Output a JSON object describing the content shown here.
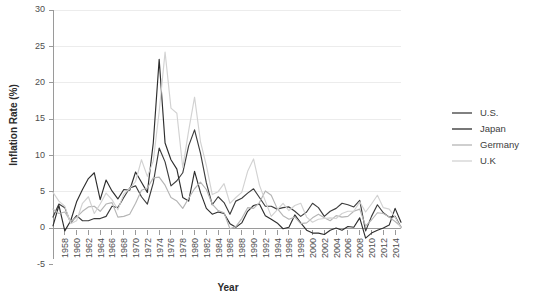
{
  "chart_data": {
    "type": "line",
    "title": "",
    "xlabel": "Year",
    "ylabel": "Inflation Rate (%)",
    "xlim": [
      1956,
      2015
    ],
    "ylim": [
      -5,
      30
    ],
    "yticks": [
      -5,
      0,
      5,
      10,
      15,
      20,
      25,
      30
    ],
    "xticks": [
      1958,
      1960,
      1962,
      1964,
      1966,
      1968,
      1970,
      1972,
      1974,
      1976,
      1978,
      1980,
      1982,
      1984,
      1986,
      1988,
      1990,
      1992,
      1994,
      1996,
      1998,
      2000,
      2002,
      2004,
      2006,
      2008,
      2010,
      2012,
      2014
    ],
    "grid": "horizontal",
    "legend_position": "right",
    "x": [
      1956,
      1957,
      1958,
      1959,
      1960,
      1961,
      1962,
      1963,
      1964,
      1965,
      1966,
      1967,
      1968,
      1969,
      1970,
      1971,
      1972,
      1973,
      1974,
      1975,
      1976,
      1977,
      1978,
      1979,
      1980,
      1981,
      1982,
      1983,
      1984,
      1985,
      1986,
      1987,
      1988,
      1989,
      1990,
      1991,
      1992,
      1993,
      1994,
      1995,
      1996,
      1997,
      1998,
      1999,
      2000,
      2001,
      2002,
      2003,
      2004,
      2005,
      2006,
      2007,
      2008,
      2009,
      2010,
      2011,
      2012,
      2013,
      2014,
      2015
    ],
    "series": [
      {
        "name": "U.S.",
        "color": "#3d3d3d",
        "values": [
          1.5,
          3.3,
          2.8,
          0.7,
          1.7,
          1.0,
          1.0,
          1.3,
          1.3,
          1.6,
          3.0,
          2.8,
          4.2,
          5.5,
          5.8,
          4.3,
          3.3,
          6.2,
          11.0,
          9.1,
          5.8,
          6.5,
          7.6,
          11.3,
          13.5,
          10.3,
          6.2,
          3.2,
          4.3,
          3.5,
          1.9,
          3.7,
          4.1,
          4.8,
          5.4,
          4.2,
          3.0,
          3.0,
          2.6,
          2.8,
          2.9,
          2.3,
          1.6,
          2.2,
          3.4,
          2.8,
          1.6,
          2.3,
          2.7,
          3.4,
          3.2,
          2.9,
          3.8,
          -0.4,
          1.6,
          3.2,
          2.1,
          1.5,
          1.6,
          0.1
        ]
      },
      {
        "name": "Japan",
        "color": "#2e2e2e",
        "values": [
          0.3,
          3.1,
          -0.4,
          1.0,
          3.6,
          5.3,
          6.8,
          7.6,
          3.9,
          6.6,
          5.1,
          4.0,
          5.3,
          5.2,
          7.7,
          6.3,
          4.9,
          11.7,
          23.2,
          11.7,
          9.4,
          8.1,
          4.2,
          3.7,
          7.8,
          4.9,
          2.7,
          1.9,
          2.2,
          2.0,
          0.6,
          0.1,
          0.7,
          2.3,
          3.1,
          3.3,
          1.7,
          1.2,
          0.7,
          -0.1,
          0.1,
          1.8,
          0.7,
          -0.3,
          -0.7,
          -0.7,
          -0.9,
          -0.3,
          0.0,
          -0.3,
          0.2,
          0.1,
          1.4,
          -1.4,
          -0.7,
          -0.3,
          0.0,
          0.4,
          2.7,
          0.8
        ]
      },
      {
        "name": "Germany",
        "color": "#b5b5b5",
        "values": [
          2.6,
          2.0,
          2.2,
          0.9,
          1.5,
          2.3,
          2.9,
          3.0,
          2.3,
          3.3,
          3.5,
          1.5,
          1.6,
          1.9,
          3.4,
          5.2,
          5.5,
          6.9,
          7.0,
          5.9,
          4.2,
          3.7,
          2.7,
          4.1,
          5.4,
          6.3,
          5.3,
          3.3,
          2.4,
          2.1,
          -0.1,
          0.2,
          1.3,
          2.8,
          2.7,
          3.5,
          5.1,
          4.5,
          2.7,
          1.7,
          1.2,
          1.5,
          0.6,
          0.7,
          1.4,
          1.9,
          1.4,
          1.0,
          1.7,
          1.5,
          1.6,
          2.3,
          2.6,
          0.3,
          1.1,
          2.1,
          2.0,
          1.5,
          0.9,
          0.2
        ]
      },
      {
        "name": "U.K",
        "color": "#d2d2d2",
        "values": [
          4.9,
          3.7,
          3.0,
          0.6,
          1.0,
          3.4,
          4.3,
          2.0,
          3.3,
          4.8,
          3.9,
          2.5,
          4.7,
          5.4,
          6.4,
          9.4,
          7.1,
          9.2,
          16.0,
          24.2,
          16.5,
          15.8,
          8.3,
          13.4,
          18.0,
          11.9,
          8.6,
          4.6,
          5.0,
          6.1,
          3.4,
          4.2,
          4.9,
          7.8,
          9.5,
          5.9,
          3.7,
          1.6,
          2.5,
          3.4,
          2.4,
          3.1,
          3.4,
          1.5,
          0.8,
          1.2,
          1.3,
          1.4,
          1.3,
          2.0,
          2.3,
          2.3,
          3.6,
          2.2,
          3.3,
          4.5,
          2.8,
          2.6,
          1.5,
          0.0
        ]
      }
    ]
  },
  "legend": {
    "items": [
      {
        "label": "U.S."
      },
      {
        "label": "Japan"
      },
      {
        "label": "Germany"
      },
      {
        "label": "U.K"
      }
    ]
  }
}
